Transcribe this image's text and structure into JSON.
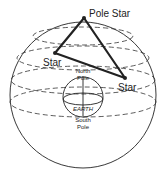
{
  "diagram": {
    "labels": {
      "pole_star": "Pole Star",
      "star_left": "Star",
      "star_right": "Star",
      "north_pole_1": "North",
      "north_pole_2": "Pole",
      "earth": "EARTH",
      "south_pole_1": "South",
      "south_pole_2": "Pole"
    },
    "colors": {
      "line": "#222222",
      "background": "#ffffff"
    }
  }
}
